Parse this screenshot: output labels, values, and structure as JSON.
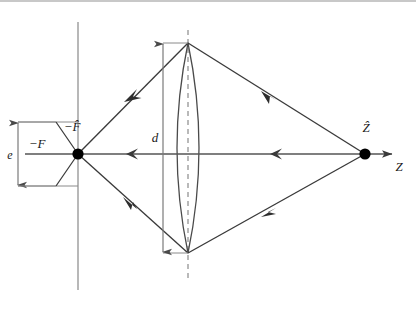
{
  "figure": {
    "background_color": "#ffffff",
    "width": 416,
    "height": 312,
    "frame": {
      "top_border_color": "#c8c8c8",
      "top_border_visible": true
    }
  },
  "colors": {
    "ray": "#3a3a3a",
    "axis": "#555555",
    "lens_outline": "#4a4a4a",
    "reference_line": "#9a9a9a",
    "dashed_axis": "#a8a8a8",
    "dimension_line": "#707070",
    "point_marker": "#000000",
    "label_text": "#1a1a1a"
  },
  "labels": {
    "focal_point_left": "−F̂",
    "plane_left": "−F",
    "aperture_height": "d",
    "entrance_height": "e",
    "image_point_right": "Ẑ",
    "axis_name": "Z"
  },
  "points": [
    {
      "name": "left-focal-point",
      "label": "−F̂",
      "x": 78,
      "y": 154
    },
    {
      "name": "right-object-point",
      "label": "Ẑ",
      "x": 365,
      "y": 154
    }
  ],
  "lens": {
    "name": "biconvex-lens",
    "center_x": 188,
    "top_y": 43,
    "bottom_y": 253,
    "bulge": 22,
    "aperture_label": "d"
  },
  "optical_axis": {
    "name": "optical-axis",
    "y": 154,
    "x_start": 25,
    "x_end": 395,
    "terminal_arrow": "right",
    "direction_arrows": [
      {
        "x": 128,
        "direction": "left"
      },
      {
        "x": 272,
        "direction": "left"
      }
    ],
    "axis_label": "Z"
  },
  "reference_lines": [
    {
      "name": "object-plane-line",
      "x": 78,
      "y_start": 22,
      "y_end": 290,
      "style": "solid",
      "color": "#9a9a9a"
    },
    {
      "name": "lens-center-dashed-line",
      "x": 188,
      "y_start": 30,
      "y_end": 282,
      "style": "dashed",
      "color": "#a8a8a8"
    }
  ],
  "rays": [
    {
      "name": "ray-upper-left",
      "from_x": 188,
      "from_y": 43,
      "to_x": 78,
      "to_y": 154,
      "arrow_at": 0.55,
      "arrow_direction": "toward-left-focus"
    },
    {
      "name": "ray-lower-left",
      "from_x": 188,
      "from_y": 253,
      "to_x": 78,
      "to_y": 154,
      "arrow_at": 0.55,
      "arrow_direction": "toward-left-focus"
    },
    {
      "name": "ray-upper-right",
      "from_x": 365,
      "from_y": 154,
      "to_x": 188,
      "to_y": 43,
      "arrow_at": 0.48,
      "arrow_direction": "toward-lens"
    },
    {
      "name": "ray-lower-right",
      "from_x": 365,
      "from_y": 154,
      "to_x": 188,
      "to_y": 253,
      "arrow_at": 0.48,
      "arrow_direction": "toward-lens"
    }
  ],
  "dimensions": [
    {
      "name": "aperture-dimension-d",
      "label": "d",
      "x": 163,
      "y_top": 43,
      "y_bottom": 253,
      "label_x": 155,
      "label_y": 142,
      "arrows": "both-ends"
    },
    {
      "name": "entrance-dimension-e",
      "label": "e",
      "x": 18,
      "y_top": 122,
      "y_bottom": 186,
      "label_x": 10,
      "label_y": 158,
      "arrows": "both-ends",
      "tick_extent_x": 78
    }
  ],
  "label_positions": {
    "focal_point_left": {
      "x": 72,
      "y": 131
    },
    "plane_left": {
      "x": 37,
      "y": 148
    },
    "image_point_right": {
      "x": 361,
      "y": 132
    },
    "axis_name": {
      "x": 397,
      "y": 170
    },
    "aperture_height": {
      "x": 155,
      "y": 142
    },
    "entrance_height": {
      "x": 10,
      "y": 158
    }
  }
}
